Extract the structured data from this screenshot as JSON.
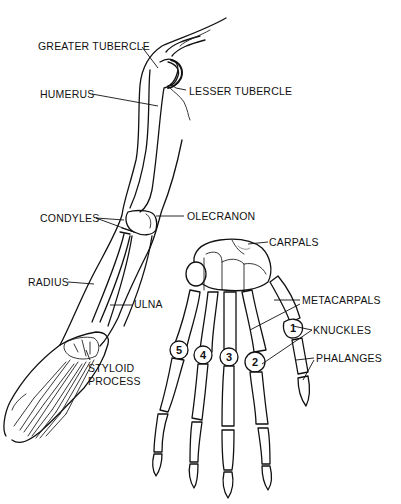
{
  "diagram": {
    "arm_labels": {
      "greater_tubercle": "GREATER TUBERCLE",
      "humerus": "HUMERUS",
      "lesser_tubercle": "LESSER TUBERCLE",
      "condyles": "CONDYLES",
      "olecranon": "OLECRANON",
      "radius": "RADIUS",
      "ulna": "ULNA",
      "styloid_process_line1": "STYLOID",
      "styloid_process_line2": "PROCESS"
    },
    "hand_labels": {
      "carpals": "CARPALS",
      "metacarpals": "METACARPALS",
      "knuckles": "KNUCKLES",
      "phalanges": "PHALANGES"
    },
    "knuckle_numbers": [
      "1",
      "2",
      "3",
      "4",
      "5"
    ],
    "colors": {
      "line": "#111111",
      "background": "#ffffff"
    }
  }
}
